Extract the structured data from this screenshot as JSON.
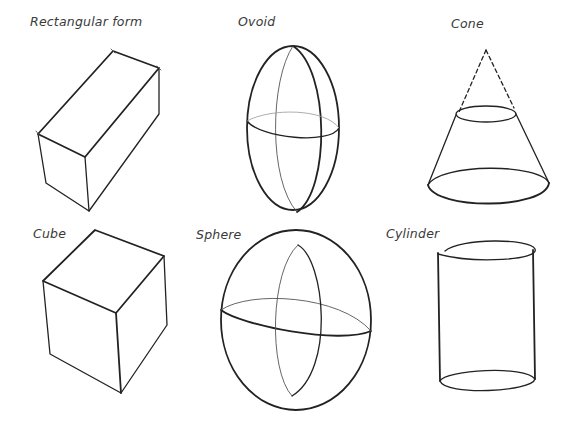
{
  "shapes": [
    {
      "id": "rectangular-form",
      "label": "Rectangular form"
    },
    {
      "id": "ovoid",
      "label": "Ovoid"
    },
    {
      "id": "cone",
      "label": "Cone"
    },
    {
      "id": "cube",
      "label": "Cube"
    },
    {
      "id": "sphere",
      "label": "Sphere"
    },
    {
      "id": "cylinder",
      "label": "Cylinder"
    }
  ]
}
